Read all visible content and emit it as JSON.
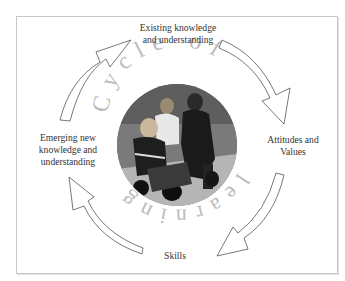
{
  "diagram": {
    "title_arc": "Cycle of learning",
    "title_letters_top": [
      "C",
      "y",
      "c",
      "l",
      "e",
      " ",
      "o",
      "f"
    ],
    "title_letters_bottom": [
      "l",
      "e",
      "a",
      "r",
      "n",
      "i",
      "n",
      "g"
    ],
    "nodes": [
      {
        "id": "existing",
        "lines": [
          "Existing knowledge",
          "and understanding"
        ],
        "position": "top"
      },
      {
        "id": "attitudes",
        "lines": [
          "Attitudes and",
          "Values"
        ],
        "position": "right"
      },
      {
        "id": "skills",
        "lines": [
          "Skills"
        ],
        "position": "bottom"
      },
      {
        "id": "emerging",
        "lines": [
          "Emerging new",
          "knowledge and",
          "understanding"
        ],
        "position": "left"
      }
    ],
    "edges": [
      {
        "from": "existing",
        "to": "attitudes"
      },
      {
        "from": "attitudes",
        "to": "skills"
      },
      {
        "from": "skills",
        "to": "emerging"
      },
      {
        "from": "emerging",
        "to": "existing"
      }
    ],
    "center_image": "photo of adult and children with toy ride-on vehicle (grayscale)",
    "colors": {
      "arrow_stroke": "#555555",
      "arc_text": "#bcbcbc",
      "frame": "#c8c8c8",
      "label_text": "#333333"
    }
  }
}
